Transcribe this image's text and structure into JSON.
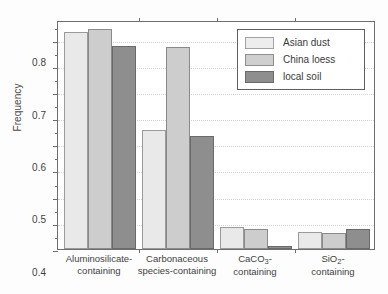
{
  "chart_data": {
    "type": "bar",
    "title": "",
    "xlabel": "",
    "ylabel": "Frequency",
    "ylim": [
      0.0,
      0.875
    ],
    "ytick_labels": [
      "0.0",
      "0.1",
      "0.2",
      "0.3",
      "0.4",
      "0.5",
      "0.6",
      "0.7",
      "0.8"
    ],
    "ytick_values": [
      0.0,
      0.1,
      0.2,
      0.3,
      0.4,
      0.5,
      0.6,
      0.7,
      0.8
    ],
    "yminor_values": [
      0.05,
      0.15,
      0.25,
      0.35,
      0.45,
      0.55,
      0.65,
      0.75,
      0.85
    ],
    "grid": "horizontal-dotted",
    "legend_position": "top-right",
    "categories": [
      {
        "line1": "Aluminosilicate-",
        "line2": "containing"
      },
      {
        "line1": "Carbonaceous",
        "line2": "species-containing"
      },
      {
        "line1_html": "CaCO<sub>3</sub>-",
        "line2": "containing"
      },
      {
        "line1_html": "SiO<sub>2</sub>-",
        "line2": "containing"
      }
    ],
    "series": [
      {
        "name": "Asian dust",
        "color": "#e9e9e9",
        "values": [
          0.83,
          0.455,
          0.085,
          0.065
        ]
      },
      {
        "name": "China loess",
        "color": "#cdcdcd",
        "values": [
          0.84,
          0.77,
          0.078,
          0.06
        ]
      },
      {
        "name": "local soil",
        "color": "#8e8e8e",
        "values": [
          0.775,
          0.43,
          0.012,
          0.078
        ]
      }
    ]
  }
}
